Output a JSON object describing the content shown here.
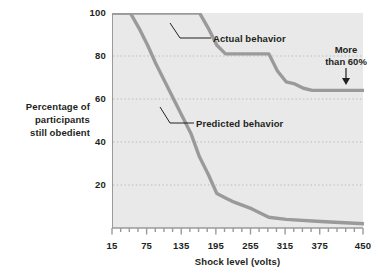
{
  "chart_data": {
    "type": "line",
    "title": "",
    "xlabel": "Shock level (volts)",
    "ylabel": "Percentage of participants still obedient",
    "ylabel_lines": [
      "Percentage of",
      "participants",
      "still obedient"
    ],
    "xlim": [
      15,
      450
    ],
    "ylim": [
      0,
      100
    ],
    "grid": "horizontal-dotted",
    "legend": "inline-annotations",
    "x_ticks_major": [
      15,
      75,
      135,
      195,
      255,
      315,
      375,
      450
    ],
    "x_ticks_minor_step": 15,
    "y_ticks": [
      20,
      40,
      60,
      80,
      100
    ],
    "series": [
      {
        "name": "Actual behavior",
        "color": "#9a9a9a",
        "x": [
          15,
          150,
          165,
          180,
          195,
          210,
          270,
          285,
          300,
          315,
          330,
          345,
          360,
          450
        ],
        "values": [
          100,
          100,
          100,
          93,
          85,
          81,
          81,
          81,
          73,
          68,
          67,
          65,
          64,
          64
        ]
      },
      {
        "name": "Predicted behavior",
        "color": "#9a9a9a",
        "x": [
          15,
          45,
          60,
          75,
          90,
          105,
          120,
          135,
          150,
          165,
          180,
          195,
          210,
          225,
          255,
          285,
          315,
          375,
          450
        ],
        "values": [
          100,
          100,
          93,
          85,
          76,
          68,
          60,
          52,
          44,
          33,
          25,
          16,
          14,
          12,
          9,
          5,
          4,
          3,
          2
        ]
      }
    ],
    "annotations": [
      {
        "id": "actual",
        "text": "Actual behavior",
        "target_series": "Actual behavior"
      },
      {
        "id": "predicted",
        "text": "Predicted behavior",
        "target_series": "Predicted behavior"
      },
      {
        "id": "callout",
        "text_lines": [
          "More",
          "than 60%"
        ],
        "text": "More than 60%",
        "arrow": "down"
      }
    ],
    "colors": {
      "plot_background": "#e9e9e9",
      "line": "#9a9a9a",
      "axis": "#9a9a9a",
      "gridline": "#b9b9b9",
      "text": "#231f20"
    }
  }
}
